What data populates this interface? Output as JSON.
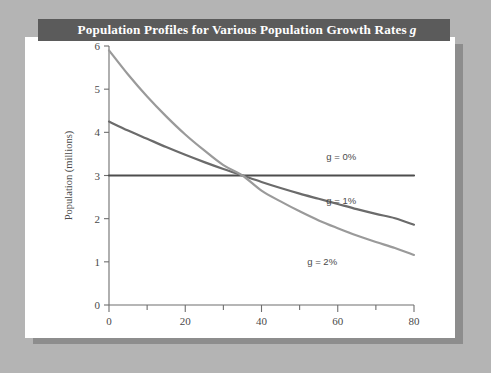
{
  "figure": {
    "background_color": "#b4b4b4",
    "panel_color": "#ffffff",
    "shadow_color": "#8d8d8d"
  },
  "title_bar": {
    "background_color": "#5b5b5b",
    "text_color": "#ffffff",
    "text_main": "Population Profiles for Various Population Growth Rates",
    "text_italic": "g"
  },
  "chart_data": {
    "type": "line",
    "xlabel": "Age (years)",
    "ylabel": "Population (millions)",
    "xlim": [
      0,
      80
    ],
    "ylim": [
      0,
      6
    ],
    "xticks": [
      0,
      20,
      40,
      60,
      80
    ],
    "xtick_labels": [
      "0",
      "20",
      "40",
      "60",
      "80"
    ],
    "xminor_ticks": [
      10,
      30,
      50,
      70
    ],
    "yticks": [
      0,
      1,
      2,
      3,
      4,
      5,
      6
    ],
    "ytick_labels": [
      "0",
      "1",
      "2",
      "3",
      "4",
      "5",
      "6"
    ],
    "grid": false,
    "legend_position": "inline-annotations",
    "x": [
      0,
      5,
      10,
      15,
      20,
      25,
      30,
      35,
      40,
      45,
      50,
      55,
      60,
      65,
      70,
      75,
      80
    ],
    "series": [
      {
        "name": "g = 0%",
        "label": "g = 0%",
        "color": "#4d4d4d",
        "values": [
          3.0,
          3.0,
          3.0,
          3.0,
          3.0,
          3.0,
          3.0,
          3.0,
          3.0,
          3.0,
          3.0,
          3.0,
          3.0,
          3.0,
          3.0,
          3.0,
          3.0
        ],
        "label_x": 57,
        "label_y": 3.35
      },
      {
        "name": "g = 1%",
        "label": "g = 1%",
        "color": "#6b6b6b",
        "values": [
          4.25,
          4.04,
          3.85,
          3.66,
          3.48,
          3.31,
          3.15,
          3.0,
          2.85,
          2.71,
          2.58,
          2.46,
          2.34,
          2.22,
          2.11,
          2.01,
          1.86
        ],
        "label_x": 57,
        "label_y": 2.35
      },
      {
        "name": "g = 2%",
        "label": "g = 2%",
        "color": "#9a9a9a",
        "values": [
          5.9,
          5.34,
          4.83,
          4.37,
          3.95,
          3.58,
          3.24,
          3.0,
          2.65,
          2.4,
          2.17,
          1.96,
          1.78,
          1.61,
          1.46,
          1.32,
          1.16
        ],
        "label_x": 52,
        "label_y": 0.92
      }
    ],
    "annotations": [
      {
        "text": "g = 0%",
        "x": 57,
        "y": 3.35
      },
      {
        "text": "g = 1%",
        "x": 57,
        "y": 2.35
      },
      {
        "text": "g = 2%",
        "x": 52,
        "y": 0.92
      }
    ]
  }
}
